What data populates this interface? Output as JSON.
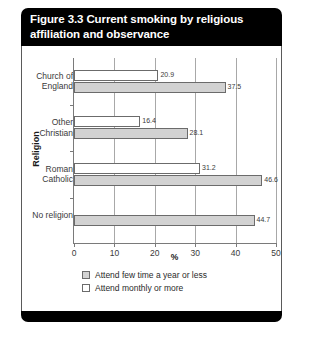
{
  "figure": {
    "title": "Figure 3.3 Current smoking by religious affiliation and observance"
  },
  "chart_data": {
    "type": "bar",
    "orientation": "horizontal",
    "title": "Figure 3.3 Current smoking by religious affiliation and observance",
    "xlabel": "%",
    "ylabel": "Religion",
    "xlim": [
      0,
      50
    ],
    "xticks": [
      0,
      10,
      20,
      30,
      40,
      50
    ],
    "grid": true,
    "legend_position": "bottom-left",
    "categories": [
      "Church of England",
      "Other Christian",
      "Roman Catholic",
      "No religion"
    ],
    "series": [
      {
        "name": "Attend monthly or more",
        "color": "#ffffff",
        "values": [
          20.9,
          16.4,
          31.2,
          null
        ]
      },
      {
        "name": "Attend few time a year or less",
        "color": "#d2d2d2",
        "values": [
          37.5,
          28.1,
          46.6,
          44.7
        ]
      }
    ]
  },
  "legend": {
    "items": [
      {
        "label": "Attend few time a year or less",
        "swatch": "grey"
      },
      {
        "label": "Attend monthly or more",
        "swatch": "white"
      }
    ]
  }
}
